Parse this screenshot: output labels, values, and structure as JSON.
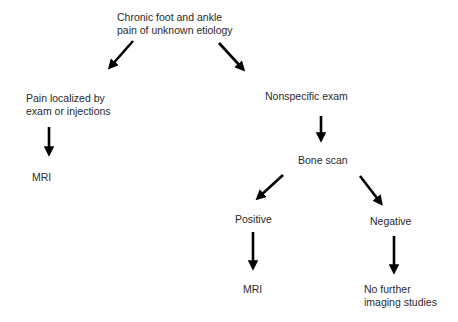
{
  "diagram": {
    "type": "flowchart",
    "nodes": {
      "root": {
        "line1": "Chronic foot and ankle",
        "line2": "pain of unknown etiology"
      },
      "localized": {
        "line1": "Pain localized by",
        "line2": "exam or injections"
      },
      "localized_result": {
        "label": "MRI"
      },
      "nonspecific": {
        "label": "Nonspecific exam"
      },
      "bone_scan": {
        "label": "Bone scan"
      },
      "positive": {
        "label": "Positive"
      },
      "positive_result": {
        "label": "MRI"
      },
      "negative": {
        "label": "Negative"
      },
      "negative_result": {
        "line1": "No further",
        "line2": "imaging studies"
      }
    },
    "edges": [
      {
        "from": "root",
        "to": "localized"
      },
      {
        "from": "root",
        "to": "nonspecific"
      },
      {
        "from": "localized",
        "to": "localized_result"
      },
      {
        "from": "nonspecific",
        "to": "bone_scan"
      },
      {
        "from": "bone_scan",
        "to": "positive"
      },
      {
        "from": "bone_scan",
        "to": "negative"
      },
      {
        "from": "positive",
        "to": "positive_result"
      },
      {
        "from": "negative",
        "to": "negative_result"
      }
    ],
    "colors": {
      "text": "#2a2a2a",
      "arrow": "#000000",
      "background": "#ffffff"
    }
  }
}
